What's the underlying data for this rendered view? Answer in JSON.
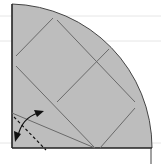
{
  "diagram": {
    "type": "fold-diagram",
    "shape": "quarter-circle",
    "colors": {
      "fill": "#bdbdbd",
      "outline": "#333333",
      "crease": "#6a6a6a",
      "ruled_line": "#e6e6e6",
      "arrow": "#111111"
    },
    "icons": {
      "fold_arrow": "curved-double-arrow",
      "valley_fold": "dashed-line"
    }
  }
}
